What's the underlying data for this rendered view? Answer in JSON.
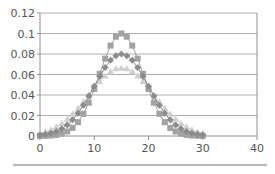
{
  "chart_data": {
    "type": "scatter",
    "title": "",
    "xlabel": "",
    "ylabel": "",
    "xlim": [
      0,
      40
    ],
    "ylim": [
      0,
      0.12
    ],
    "xticks": [
      0,
      10,
      20,
      30,
      40
    ],
    "xtick_labels": [
      "0",
      "10",
      "20",
      "30",
      "40"
    ],
    "yticks": [
      0,
      0.02,
      0.04,
      0.06,
      0.08,
      0.1,
      0.12
    ],
    "ytick_labels": [
      "0",
      "0.02",
      "0.04",
      "0.06",
      "0.08",
      "0.1",
      "0.12"
    ],
    "grid": "horizontal",
    "legend": "none",
    "x": [
      0,
      1,
      2,
      3,
      4,
      5,
      6,
      7,
      8,
      9,
      10,
      11,
      12,
      13,
      14,
      15,
      16,
      17,
      18,
      19,
      20,
      21,
      22,
      23,
      24,
      25,
      26,
      27,
      28,
      29,
      30
    ],
    "series": [
      {
        "name": "series-squares",
        "marker": "square",
        "color": "#a2a2a2",
        "values": [
          0.0001,
          0.0002,
          0.0005,
          0.0011,
          0.0023,
          0.0044,
          0.0079,
          0.0135,
          0.0216,
          0.0325,
          0.0458,
          0.0607,
          0.0755,
          0.0882,
          0.0969,
          0.1,
          0.0969,
          0.0882,
          0.0755,
          0.0607,
          0.0458,
          0.0325,
          0.0216,
          0.0135,
          0.0079,
          0.0044,
          0.0023,
          0.0011,
          0.0005,
          0.0002,
          0.0001
        ]
      },
      {
        "name": "series-diamonds",
        "marker": "diamond",
        "color": "#8c8c8c",
        "values": [
          0.0009,
          0.0016,
          0.0027,
          0.0045,
          0.0071,
          0.0108,
          0.0158,
          0.0222,
          0.03,
          0.039,
          0.0485,
          0.0581,
          0.0668,
          0.0739,
          0.0784,
          0.08,
          0.0784,
          0.0739,
          0.0668,
          0.0581,
          0.0485,
          0.039,
          0.03,
          0.0222,
          0.0158,
          0.0108,
          0.0071,
          0.0045,
          0.0027,
          0.0016,
          0.0009
        ]
      },
      {
        "name": "series-triangles",
        "marker": "triangle",
        "color": "#cfcfcf",
        "values": [
          0.0029,
          0.0042,
          0.006,
          0.0089,
          0.0123,
          0.0164,
          0.0214,
          0.0271,
          0.0334,
          0.0401,
          0.0468,
          0.0531,
          0.0585,
          0.0627,
          0.0656,
          0.066,
          0.0656,
          0.0627,
          0.0585,
          0.0531,
          0.0468,
          0.0401,
          0.0334,
          0.0271,
          0.0214,
          0.0164,
          0.0123,
          0.0089,
          0.006,
          0.0042,
          0.0029
        ]
      }
    ]
  },
  "colors": {
    "grid": "#b0b0b0",
    "axis": "#909090",
    "bottom_rule": "#b8b8b8"
  }
}
